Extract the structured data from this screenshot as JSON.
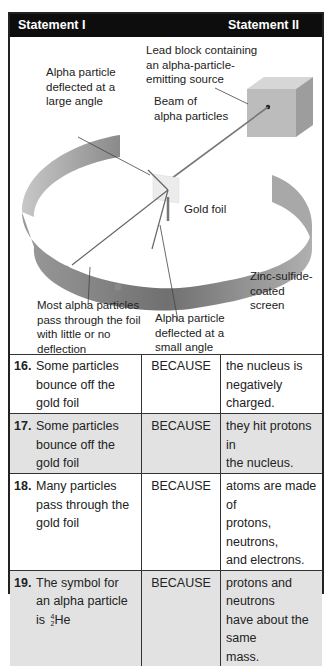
{
  "header": {
    "statement_i": "Statement I",
    "statement_ii": "Statement II"
  },
  "diagram": {
    "labels": {
      "lead_block": [
        "Lead block containing",
        "an alpha-particle-",
        "emitting source"
      ],
      "large_angle": [
        "Alpha particle",
        "deflected at a",
        "large angle"
      ],
      "beam": [
        "Beam of",
        "alpha particles"
      ],
      "gold_foil": "Gold foil",
      "screen": [
        "Zinc-sulfide-",
        "coated screen"
      ],
      "most_pass": [
        "Most alpha particles",
        "pass through the foil",
        "with little or no",
        "deflection"
      ],
      "small_angle": [
        "Alpha particle",
        "deflected at a",
        "small angle"
      ]
    },
    "colors": {
      "header_bg": "#0d0d0d",
      "alt_row_bg": "#e2e2e2",
      "ring_dark": "#6e6e6e",
      "ring_light": "#b5b5b5",
      "foil": "#ececec",
      "block": "#bdbdbd"
    }
  },
  "questions": [
    {
      "number": "16.",
      "statement_i": [
        "Some particles",
        "bounce off the",
        "gold foil"
      ],
      "connector": "BECAUSE",
      "statement_ii": [
        "the nucleus is",
        "negatively charged."
      ]
    },
    {
      "number": "17.",
      "statement_i": [
        "Some particles",
        "bounce off the",
        "gold foil"
      ],
      "connector": "BECAUSE",
      "statement_ii": [
        "they hit protons in",
        "the nucleus."
      ]
    },
    {
      "number": "18.",
      "statement_i": [
        "Many particles",
        "pass through the",
        "gold foil"
      ],
      "connector": "BECAUSE",
      "statement_ii": [
        "atoms are made of",
        "protons, neutrons,",
        "and electrons."
      ]
    },
    {
      "number": "19.",
      "statement_i": [
        "The symbol for",
        "an alpha particle",
        "is"
      ],
      "isotope": {
        "mass": "4",
        "atomic": "2",
        "symbol": "He"
      },
      "connector": "BECAUSE",
      "statement_ii": [
        "protons and neutrons",
        "have about the same",
        "mass."
      ]
    }
  ]
}
